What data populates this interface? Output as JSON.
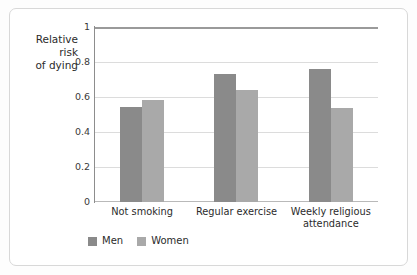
{
  "chart_data": {
    "type": "bar",
    "title": "",
    "xlabel": "",
    "ylabel": "Relative\nrisk\nof dying",
    "ylim": [
      0,
      1
    ],
    "yticks": [
      "0",
      "0.2",
      "0.4",
      "0.6",
      "0.8",
      "1"
    ],
    "grid": true,
    "legend_position": "bottom-left",
    "categories": [
      "Not smoking",
      "Regular exercise",
      "Weekly religious\nattendance"
    ],
    "series": [
      {
        "name": "Men",
        "color": "#8a8a8a",
        "values": [
          0.54,
          0.73,
          0.76
        ]
      },
      {
        "name": "Women",
        "color": "#a9a9a9",
        "values": [
          0.585,
          0.64,
          0.535
        ]
      }
    ]
  },
  "legend": {
    "items": [
      {
        "label": "Men",
        "color": "#8a8a8a"
      },
      {
        "label": "Women",
        "color": "#a9a9a9"
      }
    ]
  }
}
